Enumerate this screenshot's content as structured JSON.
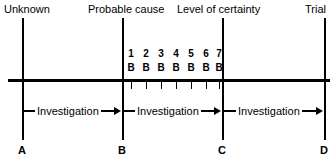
{
  "diagram": {
    "axis": {
      "y": 80,
      "x_start": 8,
      "x_end": 330,
      "color": "#000000"
    },
    "boundaries": [
      {
        "id": "A",
        "point_label": "A",
        "top_label": "Unknown",
        "x": 22,
        "label_align": "left"
      },
      {
        "id": "B",
        "point_label": "B",
        "top_label": "Probable cause",
        "x": 122,
        "label_align": "center"
      },
      {
        "id": "C",
        "point_label": "C",
        "top_label": "Level of certainty",
        "x": 222,
        "label_align": "center"
      },
      {
        "id": "D",
        "point_label": "D",
        "top_label": "Trial",
        "x": 324,
        "label_align": "right"
      }
    ],
    "ticks": [
      {
        "number": "1",
        "sub": "B",
        "x": 131
      },
      {
        "number": "2",
        "sub": "B",
        "x": 146
      },
      {
        "number": "3",
        "sub": "B",
        "x": 161
      },
      {
        "number": "4",
        "sub": "B",
        "x": 176
      },
      {
        "number": "5",
        "sub": "B",
        "x": 191
      },
      {
        "number": "6",
        "sub": "B",
        "x": 206
      },
      {
        "number": "7",
        "sub": "B",
        "x": 219
      }
    ],
    "segments": [
      {
        "label": "Investigation",
        "from": "A",
        "to": "B",
        "x_start": 22,
        "x_end": 122
      },
      {
        "label": "Investigation",
        "from": "B",
        "to": "C",
        "x_start": 122,
        "x_end": 222
      },
      {
        "label": "Investigation",
        "from": "C",
        "to": "D",
        "x_start": 222,
        "x_end": 324
      }
    ]
  }
}
